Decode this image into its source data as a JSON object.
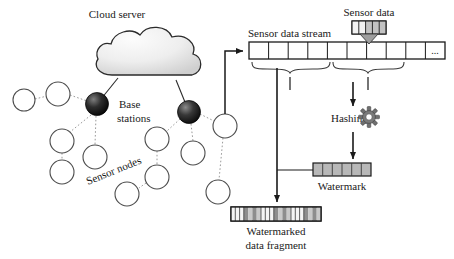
{
  "figure": {
    "background": "#ffffff",
    "stroke": "#1a1a1a"
  },
  "labels": {
    "cloud_server": "Cloud server",
    "base_stations": "Base\nstations",
    "base_stations_line1": "Base",
    "base_stations_line2": "stations",
    "sensor_nodes": "Sensor nodes",
    "sensor_data_stream": "Sensor data stream",
    "sensor_data": "Sensor data",
    "hashing": "Hashing",
    "watermark": "Watermark",
    "watermarked_fragment_line1": "Watermarked",
    "watermarked_fragment_line2": "data fragment",
    "ellipsis": "..."
  },
  "icons": {
    "cloud": "cloud-icon",
    "gear": "gear-icon",
    "base_station": "base-station-node-icon",
    "sensor_node": "sensor-node-icon",
    "arrow": "arrow-icon",
    "brace": "curly-brace-icon"
  },
  "colors": {
    "stroke": "#1a1a1a",
    "node_fill": "#ffffff",
    "node_stroke": "#555555",
    "base_station_dark": "#0d0d0d",
    "base_station_mid": "#4a4a4a",
    "cloud_fill_top": "#f7f7f7",
    "cloud_fill_bottom": "#d6d6d6",
    "cell_fill": "#ffffff",
    "watermark_cell_fill": "#b8b8b8",
    "fragment_dark_cell": "#8a8a8a",
    "gear_fill": "#6b6b6b",
    "dotted_link": "#9a9a9a"
  },
  "network": {
    "cloud": {
      "cx": 150,
      "cy": 56,
      "rx": 55,
      "ry": 27
    },
    "base_stations": [
      {
        "name": "base-station-left",
        "cx": 97,
        "cy": 104,
        "r": 11
      },
      {
        "name": "base-station-right",
        "cx": 189,
        "cy": 112,
        "r": 11
      }
    ],
    "sensor_nodes": [
      {
        "name": "sensor-node-1",
        "cx": 24,
        "cy": 100,
        "r": 11
      },
      {
        "name": "sensor-node-2",
        "cx": 58,
        "cy": 94,
        "r": 12
      },
      {
        "name": "sensor-node-3",
        "cx": 62,
        "cy": 141,
        "r": 12
      },
      {
        "name": "sensor-node-4",
        "cx": 62,
        "cy": 172,
        "r": 12
      },
      {
        "name": "sensor-node-5",
        "cx": 95,
        "cy": 157,
        "r": 12
      },
      {
        "name": "sensor-node-6",
        "cx": 157,
        "cy": 139,
        "r": 12
      },
      {
        "name": "sensor-node-7",
        "cx": 157,
        "cy": 177,
        "r": 12
      },
      {
        "name": "sensor-node-8",
        "cx": 127,
        "cy": 194,
        "r": 12
      },
      {
        "name": "sensor-node-9",
        "cx": 193,
        "cy": 153,
        "r": 12
      },
      {
        "name": "sensor-node-10",
        "cx": 225,
        "cy": 126,
        "r": 12
      },
      {
        "name": "sensor-node-11",
        "cx": 218,
        "cy": 192,
        "r": 12
      }
    ],
    "links": [
      {
        "from": "cloud",
        "to": "base-station-left",
        "style": "solid"
      },
      {
        "from": "cloud",
        "to": "base-station-right",
        "style": "solid"
      },
      {
        "from": "base-station-left",
        "to": "sensor-node-2",
        "style": "dotted"
      },
      {
        "from": "sensor-node-2",
        "to": "sensor-node-1",
        "style": "dotted"
      },
      {
        "from": "base-station-left",
        "to": "sensor-node-3",
        "style": "dotted"
      },
      {
        "from": "sensor-node-3",
        "to": "sensor-node-4",
        "style": "dotted"
      },
      {
        "from": "base-station-left",
        "to": "sensor-node-5",
        "style": "dotted"
      },
      {
        "from": "base-station-right",
        "to": "sensor-node-6",
        "style": "dotted"
      },
      {
        "from": "sensor-node-6",
        "to": "sensor-node-7",
        "style": "dotted"
      },
      {
        "from": "sensor-node-7",
        "to": "sensor-node-8",
        "style": "dotted"
      },
      {
        "from": "base-station-right",
        "to": "sensor-node-9",
        "style": "dotted"
      },
      {
        "from": "base-station-right",
        "to": "sensor-node-10",
        "style": "dotted"
      },
      {
        "from": "sensor-node-10",
        "to": "sensor-node-11",
        "style": "dotted"
      }
    ]
  },
  "stream": {
    "label": "Sensor data stream",
    "x": 249,
    "y": 42,
    "width": 196,
    "height": 17,
    "cell_count": 10,
    "last_cell_text": "...",
    "braces": [
      {
        "name": "fragment-brace-left",
        "x1": 252,
        "x2": 330
      },
      {
        "name": "fragment-brace-right",
        "x1": 332,
        "x2": 408
      }
    ]
  },
  "sensor_data_box": {
    "label": "Sensor data",
    "x": 334,
    "y": 21,
    "width": 34,
    "height": 14,
    "cells": [
      "light",
      "light",
      "dark",
      "dark",
      "dark"
    ]
  },
  "watermark_row": {
    "label": "Watermark",
    "x": 313,
    "y": 163,
    "width": 58,
    "height": 13,
    "cell_count": 6,
    "fill": "#b8b8b8"
  },
  "fragment_row": {
    "label_line1": "Watermarked",
    "label_line2": "data fragment",
    "x": 231,
    "y": 207,
    "width": 90,
    "height": 14,
    "groups": 3,
    "cells_per_group": 7,
    "pattern": [
      "light",
      "light",
      "light",
      "dark",
      "dark",
      "dark",
      "dark"
    ]
  },
  "arrows": [
    {
      "name": "network-to-stream-arrow",
      "description": "from sensor node up then right into stream"
    },
    {
      "name": "sensor-data-insert-arrow",
      "description": "sensor data box down into stream"
    },
    {
      "name": "stream-to-hashing-arrow",
      "description": "stream down to hashing"
    },
    {
      "name": "hashing-to-watermark-arrow",
      "description": "hashing down to watermark"
    },
    {
      "name": "stream-to-fragment-arrow",
      "description": "stream down to watermarked data fragment"
    }
  ]
}
